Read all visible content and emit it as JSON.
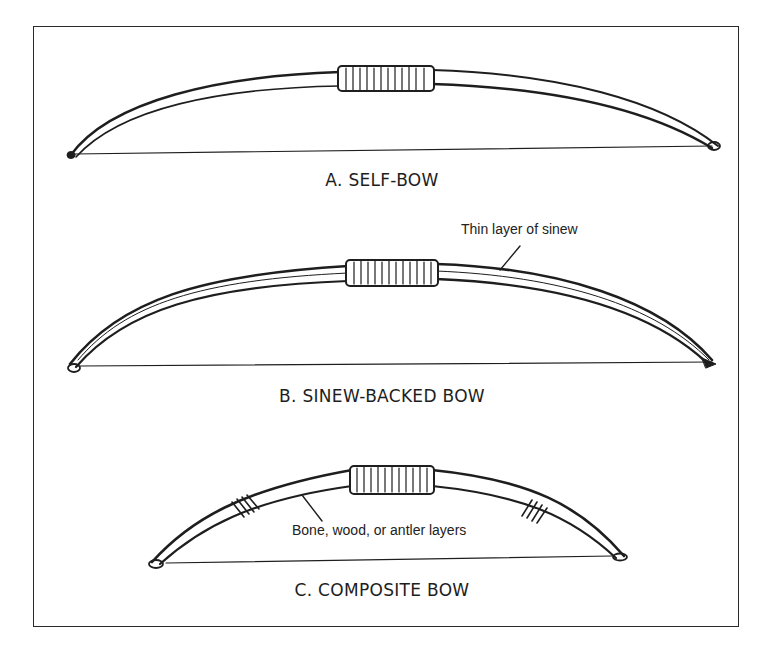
{
  "figure": {
    "bows": [
      {
        "id": "A",
        "caption": "A. SELF-BOW"
      },
      {
        "id": "B",
        "caption": "B. SINEW-BACKED BOW",
        "annotation": "Thin layer of sinew"
      },
      {
        "id": "C",
        "caption": "C. COMPOSITE BOW",
        "annotation": "Bone, wood, or antler layers"
      }
    ]
  },
  "colors": {
    "ink": "#1e1e1e",
    "background": "#ffffff"
  }
}
